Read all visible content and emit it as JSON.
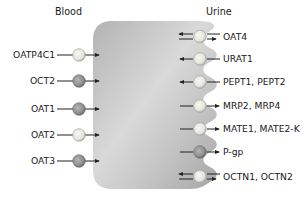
{
  "regions": {
    "blood": "Blood",
    "urine": "Urine"
  },
  "colors": {
    "cell_light": "#e6e6e6",
    "cell_dark": "#a9a9a9",
    "transporter_light": "#e9e9e2",
    "transporter_dark": "#8f8f8f",
    "line": "#222222"
  },
  "basolateral_transporters": [
    {
      "label": "OATP4C1",
      "shade": "light",
      "direction": "into-cell"
    },
    {
      "label": "OCT2",
      "shade": "dark",
      "direction": "into-cell"
    },
    {
      "label": "OAT1",
      "shade": "dark",
      "direction": "into-cell"
    },
    {
      "label": "OAT2",
      "shade": "light",
      "direction": "into-cell"
    },
    {
      "label": "OAT3",
      "shade": "dark",
      "direction": "into-cell"
    }
  ],
  "apical_transporters": [
    {
      "label": "OAT4",
      "shade": "light",
      "direction": "bidirectional"
    },
    {
      "label": "URAT1",
      "shade": "light",
      "direction": "into-cell"
    },
    {
      "label": "PEPT1, PEPT2",
      "shade": "light",
      "direction": "into-cell"
    },
    {
      "label": "MRP2, MRP4",
      "shade": "light",
      "direction": "out-of-cell"
    },
    {
      "label": "MATE1, MATE2-K",
      "shade": "light",
      "direction": "out-of-cell"
    },
    {
      "label": "P-gp",
      "shade": "dark",
      "direction": "out-of-cell"
    },
    {
      "label": "OCTN1, OCTN2",
      "shade": "light",
      "direction": "bidirectional"
    }
  ]
}
